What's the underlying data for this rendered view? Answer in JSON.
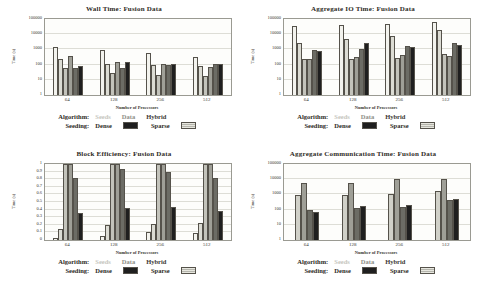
{
  "figure": {
    "background": "#ffffff",
    "description_texts": {}
  },
  "legend": {
    "algorithm_label": "Algorithm:",
    "algorithms": [
      {
        "label": "Seeds",
        "color": "#c6c6be"
      },
      {
        "label": "Data",
        "color": "#8e8e86"
      },
      {
        "label": "Hybrid",
        "color": "#3c3933"
      }
    ],
    "seeding_label": "Seeding:",
    "seedings": [
      {
        "label": "Dense",
        "style": "dense",
        "color": "#1f1f1f"
      },
      {
        "label": "Sparse",
        "style": "sparse",
        "color": "#c3c3bb"
      }
    ]
  },
  "chart_data": [
    {
      "type": "bar",
      "title": "Wall Time: Fusion Data",
      "xlabel": "Number of Processors",
      "ylabel": "Time (s)",
      "yscale": "log",
      "ymin": 1,
      "ymax": 100000,
      "grid": true,
      "legend_position": "bottom",
      "yticks": [
        {
          "label": "1",
          "value": 1
        },
        {
          "label": "10",
          "value": 10
        },
        {
          "label": "100",
          "value": 100
        },
        {
          "label": "1000",
          "value": 1000
        },
        {
          "label": "10000",
          "value": 10000
        },
        {
          "label": "100000",
          "value": 100000
        }
      ],
      "categories": [
        "64",
        "128",
        "256",
        "512"
      ],
      "series": [
        {
          "name": "Seeds Sparse",
          "color": "#f3f3ee",
          "values": [
            1500,
            900,
            550,
            300
          ]
        },
        {
          "name": "Seeds Dense",
          "color": "#dcdcd4",
          "values": [
            240,
            105,
            100,
            75
          ]
        },
        {
          "name": "Data Sparse",
          "color": "#c3c3bb",
          "values": [
            60,
            30,
            20,
            17
          ]
        },
        {
          "name": "Data Dense",
          "color": "#9f9f97",
          "values": [
            380,
            150,
            110,
            70
          ]
        },
        {
          "name": "Hybrid Sparse",
          "color": "#6c6c65",
          "values": [
            58,
            60,
            95,
            110
          ]
        },
        {
          "name": "Hybrid Dense",
          "color": "#1f1f1f",
          "values": [
            85,
            150,
            110,
            115
          ]
        }
      ]
    },
    {
      "type": "bar",
      "title": "Aggregate IO Time: Fusion Data",
      "xlabel": "Number of Processors",
      "ylabel": "Time (s)",
      "yscale": "log",
      "ymin": 1,
      "ymax": 100000,
      "grid": true,
      "legend_position": "bottom",
      "yticks": [
        {
          "label": "1",
          "value": 1
        },
        {
          "label": "10",
          "value": 10
        },
        {
          "label": "100",
          "value": 100
        },
        {
          "label": "1000",
          "value": 1000
        },
        {
          "label": "10000",
          "value": 10000
        },
        {
          "label": "100000",
          "value": 100000
        }
      ],
      "categories": [
        "64",
        "128",
        "256",
        "512"
      ],
      "series": [
        {
          "name": "Seeds Sparse",
          "color": "#f3f3ee",
          "values": [
            35000,
            40000,
            45000,
            65000
          ]
        },
        {
          "name": "Seeds Dense",
          "color": "#dcdcd4",
          "values": [
            2500,
            4500,
            7500,
            18000
          ]
        },
        {
          "name": "Data Sparse",
          "color": "#c3c3bb",
          "values": [
            220,
            230,
            260,
            500
          ]
        },
        {
          "name": "Data Dense",
          "color": "#9f9f97",
          "values": [
            240,
            300,
            430,
            350
          ]
        },
        {
          "name": "Hybrid Sparse",
          "color": "#6c6c65",
          "values": [
            850,
            1100,
            1700,
            2800
          ]
        },
        {
          "name": "Hybrid Dense",
          "color": "#1f1f1f",
          "values": [
            800,
            2600,
            1500,
            1900
          ]
        }
      ]
    },
    {
      "type": "bar",
      "title": "Block Efficiency: Fusion Data",
      "xlabel": "Number of Processors",
      "ylabel": "Time (s)",
      "yscale": "linear",
      "ymin": 0,
      "ymax": 1,
      "grid": true,
      "legend_position": "bottom",
      "yticks": [
        {
          "label": "0",
          "value": 0
        },
        {
          "label": "0.1",
          "value": 0.1
        },
        {
          "label": "0.2",
          "value": 0.2
        },
        {
          "label": "0.3",
          "value": 0.3
        },
        {
          "label": "0.4",
          "value": 0.4
        },
        {
          "label": "0.5",
          "value": 0.5
        },
        {
          "label": "0.6",
          "value": 0.6
        },
        {
          "label": "0.7",
          "value": 0.7
        },
        {
          "label": "0.8",
          "value": 0.8
        },
        {
          "label": "0.9",
          "value": 0.9
        },
        {
          "label": "1",
          "value": 1
        }
      ],
      "categories": [
        "64",
        "128",
        "256",
        "512"
      ],
      "series": [
        {
          "name": "Seeds Sparse",
          "color": "#f3f3ee",
          "values": [
            0.03,
            0.05,
            0.1,
            0.09
          ]
        },
        {
          "name": "Seeds Dense",
          "color": "#dcdcd4",
          "values": [
            0.15,
            0.2,
            0.21,
            0.22
          ]
        },
        {
          "name": "Data Sparse",
          "color": "#c3c3bb",
          "values": [
            1,
            1,
            1,
            1
          ]
        },
        {
          "name": "Data Dense",
          "color": "#9f9f97",
          "values": [
            1,
            1,
            1,
            1
          ]
        },
        {
          "name": "Hybrid Sparse",
          "color": "#6c6c65",
          "values": [
            0.82,
            0.93,
            0.9,
            0.82
          ]
        },
        {
          "name": "Hybrid Dense",
          "color": "#1f1f1f",
          "values": [
            0.36,
            0.42,
            0.43,
            0.38
          ]
        }
      ]
    },
    {
      "type": "bar",
      "title": "Aggregate Communication Time: Fusion Data",
      "xlabel": "Number of Processors",
      "ylabel": "Time (s)",
      "yscale": "log",
      "ymin": 1,
      "ymax": 100000,
      "grid": true,
      "legend_position": "bottom",
      "yticks": [
        {
          "label": "1",
          "value": 1
        },
        {
          "label": "10",
          "value": 10
        },
        {
          "label": "100",
          "value": 100
        },
        {
          "label": "1000",
          "value": 1000
        },
        {
          "label": "10000",
          "value": 10000
        },
        {
          "label": "100000",
          "value": 100000
        }
      ],
      "categories": [
        "64",
        "128",
        "256",
        "512"
      ],
      "series": [
        {
          "name": "Data Sparse",
          "color": "#d0d0c8",
          "values": [
            900,
            900,
            1100,
            1700
          ]
        },
        {
          "name": "Data Dense",
          "color": "#9f9f97",
          "values": [
            6000,
            6000,
            10000,
            11000
          ]
        },
        {
          "name": "Hybrid Sparse",
          "color": "#6c6c65",
          "values": [
            100,
            120,
            150,
            430
          ]
        },
        {
          "name": "Hybrid Dense",
          "color": "#1f1f1f",
          "values": [
            70,
            175,
            200,
            470
          ]
        }
      ]
    }
  ]
}
